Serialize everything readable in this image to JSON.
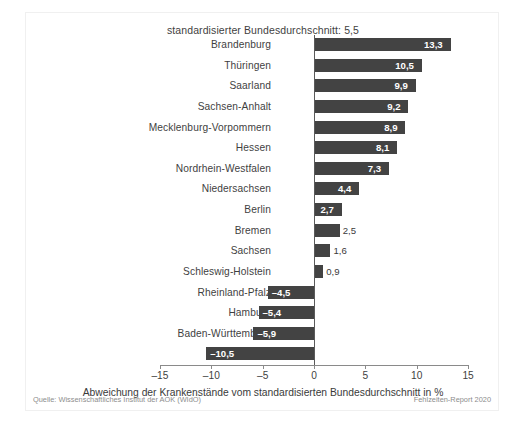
{
  "figure": {
    "title": "standardisierter Bundesdurchschnitt: 5,5",
    "source_left": "Quelle: Wissenschaftliches Institut der AOK (WIdO)",
    "source_right": "Fehlzeiten-Report 2020",
    "bar_color": "#434343",
    "axis_color": "#8a8a8a",
    "zero_line_color": "#5a5a5a",
    "text_color": "#3f3f3f",
    "footer_color": "#8d8d8d"
  },
  "chart_data": {
    "type": "bar",
    "orientation": "horizontal",
    "title": "standardisierter Bundesdurchschnitt: 5,5",
    "xlabel": "Abweichung der Krankenstände vom standardisierten Bundesdurchschnitt in %",
    "ylabel": "",
    "xlim": [
      -15,
      15
    ],
    "xticks": [
      -15,
      -10,
      -5,
      0,
      5,
      10,
      15
    ],
    "xtick_labels": [
      "–15",
      "–10",
      "–5",
      "0",
      "5",
      "10",
      "15"
    ],
    "grid": false,
    "legend": false,
    "reference_value": 5.5,
    "categories": [
      "Brandenburg",
      "Thüringen",
      "Saarland",
      "Sachsen-Anhalt",
      "Mecklenburg-Vorpommern",
      "Hessen",
      "Nordrhein-Westfalen",
      "Niedersachsen",
      "Berlin",
      "Bremen",
      "Sachsen",
      "Schleswig-Holstein",
      "Rheinland-Pfalz",
      "Hamburg",
      "Baden-Württemberg",
      "Bayern"
    ],
    "values": [
      13.3,
      10.5,
      9.9,
      9.2,
      8.9,
      8.1,
      7.3,
      4.4,
      2.7,
      2.5,
      1.6,
      0.9,
      -4.5,
      -5.4,
      -5.9,
      -10.5
    ],
    "value_labels": [
      "13,3",
      "10,5",
      "9,9",
      "9,2",
      "8,9",
      "8,1",
      "7,3",
      "4,4",
      "2,7",
      "2,5",
      "1,6",
      "0,9",
      "–4,5",
      "–5,4",
      "–5,9",
      "–10,5"
    ]
  }
}
